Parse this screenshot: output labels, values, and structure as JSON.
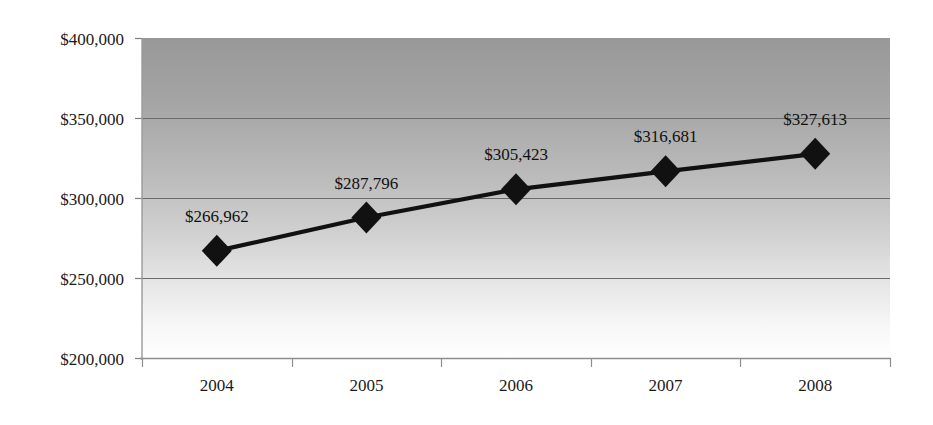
{
  "chart_data": {
    "type": "line",
    "title": "",
    "subtitle": "",
    "xlabel": "",
    "ylabel": "",
    "categories": [
      "2004",
      "2005",
      "2006",
      "2007",
      "2008"
    ],
    "values": [
      266962,
      287796,
      305423,
      316681,
      327613
    ],
    "point_labels": [
      "$266,962",
      "$287,796",
      "$305,423",
      "$316,681",
      "$327,613"
    ],
    "ylim": [
      200000,
      400000
    ],
    "ytick_values": [
      400000,
      350000,
      300000,
      250000,
      200000
    ],
    "ytick_labels": [
      "$400,000",
      "$350,000",
      "$300,000",
      "$250,000",
      "$200,000"
    ],
    "grid": true,
    "grid_axis": "y",
    "legend": "none",
    "series": [
      {
        "name": "",
        "values": [
          266962,
          287796,
          305423,
          316681,
          327613
        ],
        "marker": "diamond",
        "color": "#111111"
      }
    ],
    "colors": {
      "line": "#111111",
      "marker": "#111111",
      "gridline": "#6b6b6b",
      "axis": "#8a8a8a",
      "plot_bg_top": "#9d9d9d",
      "plot_bg_bottom": "#ffffff",
      "text": "#1a1a1a",
      "page_bg": "#ffffff"
    }
  },
  "geometry": {
    "plot_left": 142,
    "plot_right": 890,
    "plot_top": 38,
    "plot_bottom": 358
  }
}
